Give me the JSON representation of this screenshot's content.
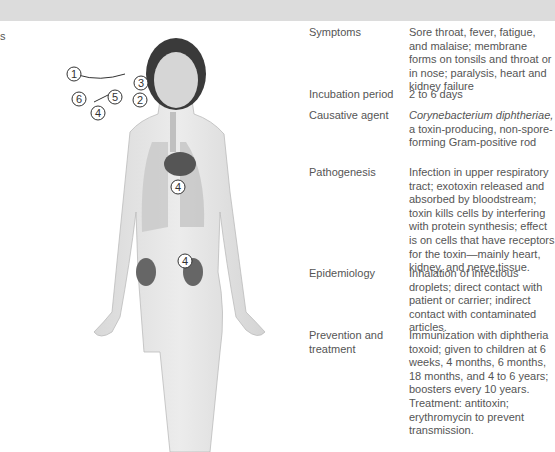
{
  "header": {
    "bar_color": "#dcdcdc"
  },
  "left_cut_text": "s",
  "figure": {
    "labels": [
      {
        "id": "1",
        "x": 59,
        "y": 53
      },
      {
        "id": "3",
        "x": 84,
        "y": 62
      },
      {
        "id": "6",
        "x": 40,
        "y": 78
      },
      {
        "id": "5",
        "x": 55,
        "y": 75
      },
      {
        "id": "2",
        "x": 81,
        "y": 79
      },
      {
        "id": "4",
        "x": 40,
        "y": 89
      },
      {
        "id": "4",
        "x": 82,
        "y": 165
      },
      {
        "id": "4",
        "x": 82,
        "y": 240
      }
    ]
  },
  "table": {
    "rows": [
      {
        "key": "Symptoms",
        "value": "Sore throat, fever, fatigue, and malaise; membrane forms on tonsils and throat or in nose; paralysis, heart and kidney failure"
      },
      {
        "key": "Incubation period",
        "value": "2 to 6 days"
      },
      {
        "key": "Causative agent",
        "value_italic": "Corynebacterium diphtheriae,",
        "value": " a toxin-producing, non-spore-forming Gram-positive rod"
      },
      {
        "key": "Pathogenesis",
        "value": "Infection in upper respiratory tract; exotoxin released and absorbed by bloodstream; toxin kills cells by interfering with protein synthesis; effect is on cells that have receptors for the toxin—mainly heart, kidney, and nerve tissue."
      },
      {
        "key": "Epidemiology",
        "value": "Inhalation of infectious droplets; direct contact with patient or carrier; indirect contact with contaminated articles."
      },
      {
        "key": "Prevention and treatment",
        "value": "Immunization with diphtheria toxoid; given to children at 6 weeks, 4 months, 6 months, 18 months, and 4 to 6 years; boosters every 10 years. Treatment: antitoxin; erythromycin to prevent transmission."
      }
    ]
  }
}
